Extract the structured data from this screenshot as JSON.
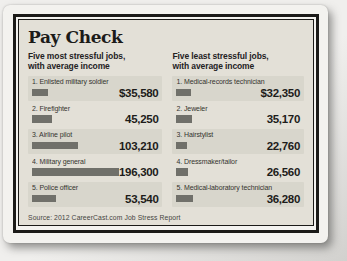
{
  "infographic": {
    "title": "Pay Check",
    "source": "Source: 2012 CareerCast.com Job Stress Report",
    "columns": [
      {
        "subtitle": "Five most stressful jobs,\nwith average income",
        "rows": [
          {
            "label": "1. Enlisted military soldier",
            "income": 35580,
            "value_display": "$35,580"
          },
          {
            "label": "2. Firefighter",
            "income": 45250,
            "value_display": "45,250"
          },
          {
            "label": "3. Airline pilot",
            "income": 103210,
            "value_display": "103,210"
          },
          {
            "label": "4. Military general",
            "income": 196300,
            "value_display": "196,300"
          },
          {
            "label": "5. Police officer",
            "income": 53540,
            "value_display": "53,540"
          }
        ]
      },
      {
        "subtitle": "Five least stressful jobs,\nwith average income",
        "rows": [
          {
            "label": "1. Medical-records technician",
            "income": 32350,
            "value_display": "$32,350"
          },
          {
            "label": "2. Jeweler",
            "income": 35170,
            "value_display": "35,170"
          },
          {
            "label": "3. Hairstylist",
            "income": 22760,
            "value_display": "22,760"
          },
          {
            "label": "4. Dressmaker/tailor",
            "income": 26560,
            "value_display": "26,560"
          },
          {
            "label": "5. Medical-laboratory technician",
            "income": 36280,
            "value_display": "36,280"
          }
        ]
      }
    ]
  },
  "colors": {
    "content_background": "#e3e0d7",
    "row_band": "#d8d6cc",
    "bar": "#70706a",
    "frame": "#1b1a18",
    "card": "#f3f2ef"
  },
  "chart_data": [
    {
      "type": "bar",
      "title": "Pay Check",
      "subtitle": "Five most stressful jobs, with average income",
      "categories": [
        "Enlisted military soldier",
        "Firefighter",
        "Airline pilot",
        "Military general",
        "Police officer"
      ],
      "values": [
        35580,
        45250,
        103210,
        196300,
        53540
      ],
      "xlabel": "",
      "ylabel": "Average income ($)",
      "orientation": "horizontal",
      "grid": false,
      "legend": false,
      "annotation": "Source: 2012 CareerCast.com Job Stress Report"
    },
    {
      "type": "bar",
      "title": "Pay Check",
      "subtitle": "Five least stressful jobs, with average income",
      "categories": [
        "Medical-records technician",
        "Jeweler",
        "Hairstylist",
        "Dressmaker/tailor",
        "Medical-laboratory technician"
      ],
      "values": [
        32350,
        35170,
        22760,
        26560,
        36280
      ],
      "xlabel": "",
      "ylabel": "Average income ($)",
      "orientation": "horizontal",
      "grid": false,
      "legend": false,
      "annotation": "Source: 2012 CareerCast.com Job Stress Report"
    }
  ]
}
